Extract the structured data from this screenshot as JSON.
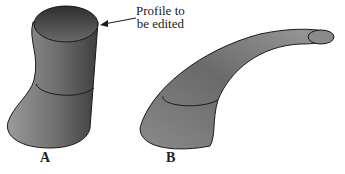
{
  "figure": {
    "callout": {
      "line1": "Profile to",
      "line2": "be edited"
    },
    "labels": {
      "a": "A",
      "b": "B"
    },
    "colors": {
      "stroke": "#1a1a1a",
      "shade_dark": "#3a3a3a",
      "shade_mid": "#707070",
      "shade_light": "#a8a8a8"
    }
  }
}
